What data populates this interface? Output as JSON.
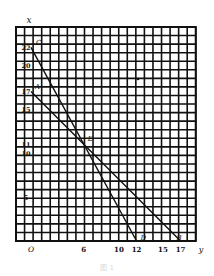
{
  "diagram": {
    "type": "coordinate-grid-with-lines",
    "grid": {
      "columns": 21,
      "rows": 25,
      "origin_column": 2
    },
    "axes": {
      "vertical_label": "x",
      "horizontal_label": "y",
      "origin_label": "O",
      "x_ticks": [
        6,
        10,
        12,
        15,
        17
      ],
      "y_ticks": [
        22,
        20,
        17,
        15,
        11,
        10,
        5
      ]
    },
    "points": [
      {
        "name": "C",
        "x": 0,
        "y": 22
      },
      {
        "name": "A",
        "x": 0,
        "y": 17
      },
      {
        "name": "E",
        "x": 6,
        "y": 11
      },
      {
        "name": "D",
        "x": 12,
        "y": 0
      },
      {
        "name": "B",
        "x": 17,
        "y": 0
      }
    ],
    "lines": [
      {
        "name": "CD",
        "from": "C",
        "to": "D"
      },
      {
        "name": "AB",
        "from": "A",
        "to": "B"
      }
    ],
    "colors": {
      "grid": "#111111",
      "background": "#ffffff",
      "line": "#111111"
    }
  },
  "caption": "图 1"
}
